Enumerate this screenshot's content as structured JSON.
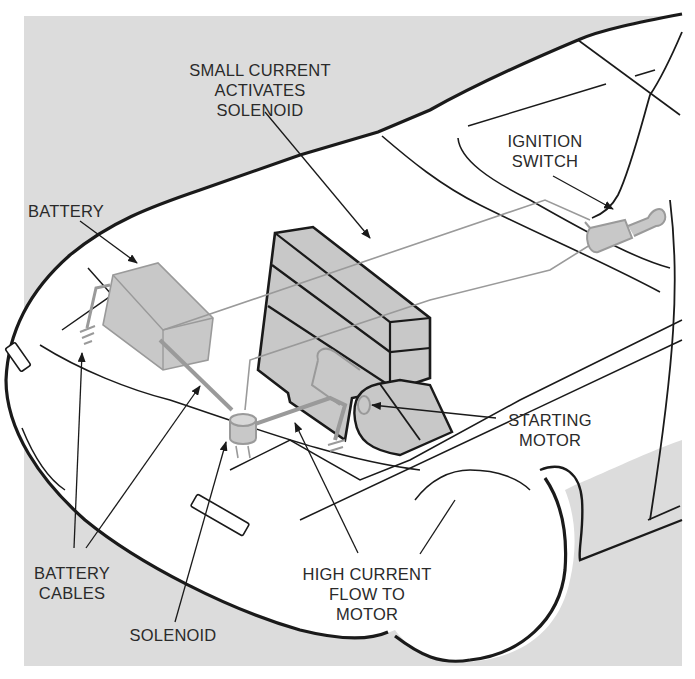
{
  "diagram": {
    "colors": {
      "background_panel": "#dcdcdc",
      "car_body": "#ffffff",
      "outline": "#1a1a1a",
      "component_fill": "#c8c8c8",
      "wiring": "#9a9a9a",
      "label_text": "#2a2a2a"
    },
    "labels": {
      "small_current": "SMALL CURRENT\nACTIVATES SOLENOID",
      "ignition_switch": "IGNITION\nSWITCH",
      "battery": "BATTERY",
      "starting_motor": "STARTING\nMOTOR",
      "battery_cables": "BATTERY\nCABLES",
      "high_current": "HIGH CURRENT\nFLOW TO\nMOTOR",
      "solenoid": "SOLENOID"
    },
    "components": [
      {
        "id": "battery",
        "name": "Battery"
      },
      {
        "id": "solenoid",
        "name": "Solenoid"
      },
      {
        "id": "starting-motor",
        "name": "Starting motor"
      },
      {
        "id": "ignition-switch",
        "name": "Ignition switch"
      },
      {
        "id": "engine-block",
        "name": "Engine block"
      }
    ]
  }
}
